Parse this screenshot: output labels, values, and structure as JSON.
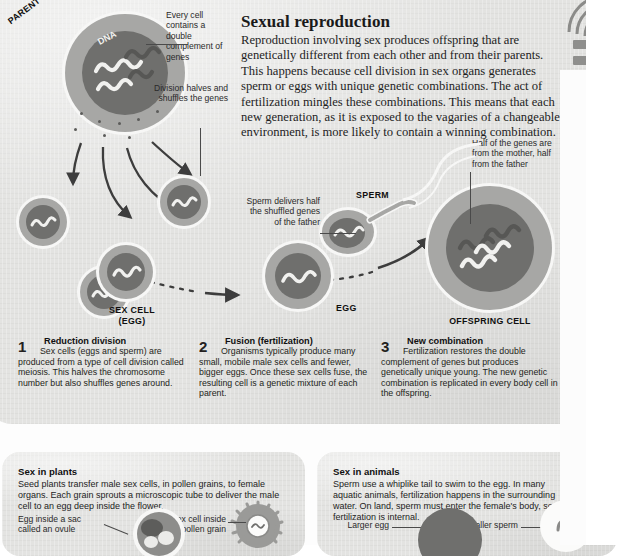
{
  "main": {
    "heading": "Sexual reproduction",
    "intro": "Reproduction involving sex produces offspring that are genetically different from each other and from their parents. This happens because cell division in sex organs generates sperm or eggs with unique genetic combinations. The act of fertilization mingles these combinations. This means that each new generation, as it is exposed to the vagaries of a changeable environment, is more likely to contain a winning combination.",
    "annotations": {
      "every_cell": "Every cell contains a double complement of genes",
      "division": "Division halves and shuffles the genes",
      "sperm_delivers": "Sperm delivers half the shuffled genes of the father",
      "half_genes": "Half of the genes are from the mother, half from the father"
    },
    "cell_labels": {
      "parent": "PARENT CELL",
      "dna": "DNA",
      "sex_cell": "SEX CELL",
      "sex_cell_sub": "(EGG)",
      "sperm": "SPERM",
      "egg": "EGG",
      "offspring": "OFFSPRING CELL"
    },
    "steps": [
      {
        "number": "1",
        "title": "Reduction division",
        "text": "Sex cells (eggs and sperm) are produced from a type of cell division called meiosis. This halves the chromosome number but also shuffles genes around."
      },
      {
        "number": "2",
        "title": "Fusion (fertilization)",
        "text": "Organisms typically produce many small, mobile male sex cells and fewer, bigger eggs. Once these sex cells fuse, the resulting cell is a genetic mixture of each parent."
      },
      {
        "number": "3",
        "title": "New combination",
        "text": "Fertilization restores the double complement of genes but produces genetically unique young. The new genetic combination is replicated in every body cell in the offspring."
      }
    ]
  },
  "plants": {
    "title": "Sex in plants",
    "text": "Seed plants transfer male sex cells, in pollen grains, to female organs. Each grain sprouts a microscopic tube to deliver the male cell to an egg deep inside the flower.",
    "label_egg": "Egg inside a sac called an ovule",
    "label_pollen": "Male sex cell inside pollen grain"
  },
  "animals": {
    "title": "Sex in animals",
    "text": "Sperm use a whiplike tail to swim to the egg. In many aquatic animals, fertilization happens in the surrounding water. On land, sperm must enter the female's body, so fertilization is internal.",
    "label_egg": "Larger egg",
    "label_sperm": "Smaller sperm"
  },
  "colors": {
    "panel_bg": "#e3e3e1",
    "cell_cytoplasm": "#a7a7a5",
    "cell_nucleus": "#6f6f6d",
    "gene_light": "#f1f1ef",
    "gene_dark": "#56565 4",
    "arrow": "#3d3d3d",
    "text": "#231f20"
  }
}
